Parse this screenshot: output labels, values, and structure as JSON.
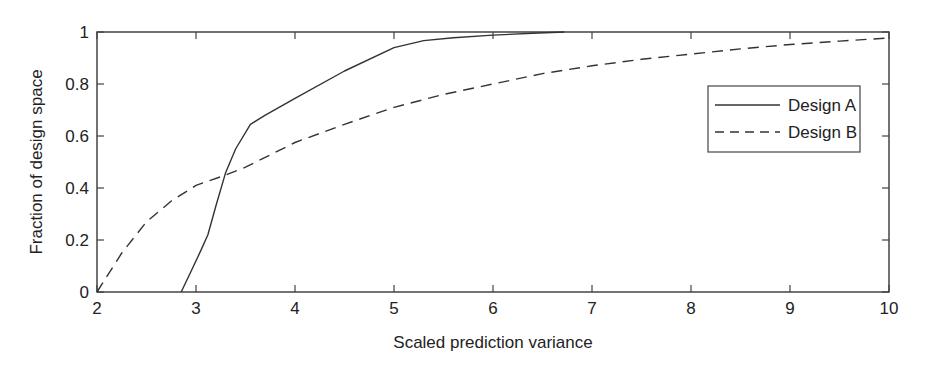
{
  "chart_data": {
    "type": "line",
    "title": "",
    "xlabel": "Scaled prediction variance",
    "ylabel": "Fraction of design space",
    "xlim": [
      2,
      10
    ],
    "ylim": [
      0,
      1
    ],
    "xticks": [
      2,
      3,
      4,
      5,
      6,
      7,
      8,
      9,
      10
    ],
    "yticks": [
      0,
      0.2,
      0.4,
      0.6,
      0.8,
      1
    ],
    "ytick_labels": [
      "0",
      "0.2",
      "0.4",
      "0.6",
      "0.8",
      "1"
    ],
    "grid": false,
    "legend_position": "right, upper-middle",
    "series": [
      {
        "name": "Design A",
        "style": "solid",
        "x": [
          2.85,
          2.95,
          3.05,
          3.12,
          3.2,
          3.3,
          3.4,
          3.55,
          3.7,
          4.0,
          4.5,
          5.0,
          5.3,
          5.6,
          6.0,
          6.4,
          6.72
        ],
        "y": [
          0.0,
          0.08,
          0.16,
          0.22,
          0.33,
          0.46,
          0.55,
          0.645,
          0.68,
          0.745,
          0.85,
          0.94,
          0.967,
          0.978,
          0.988,
          0.995,
          1.0
        ]
      },
      {
        "name": "Design B",
        "style": "dashed",
        "x": [
          2.0,
          2.1,
          2.25,
          2.5,
          2.75,
          3.0,
          3.3,
          3.5,
          4.0,
          4.5,
          5.0,
          5.5,
          6.0,
          6.5,
          7.0,
          7.5,
          8.0,
          8.5,
          9.0,
          9.5,
          10.0
        ],
        "y": [
          0.0,
          0.06,
          0.15,
          0.27,
          0.35,
          0.41,
          0.45,
          0.48,
          0.575,
          0.645,
          0.71,
          0.76,
          0.8,
          0.84,
          0.87,
          0.895,
          0.915,
          0.935,
          0.952,
          0.965,
          0.977
        ]
      }
    ]
  },
  "legend": {
    "items": [
      {
        "label": "Design A",
        "style": "solid"
      },
      {
        "label": "Design B",
        "style": "dashed"
      }
    ]
  },
  "colors": {
    "line": "#333333",
    "axis": "#444444",
    "background": "#ffffff"
  }
}
